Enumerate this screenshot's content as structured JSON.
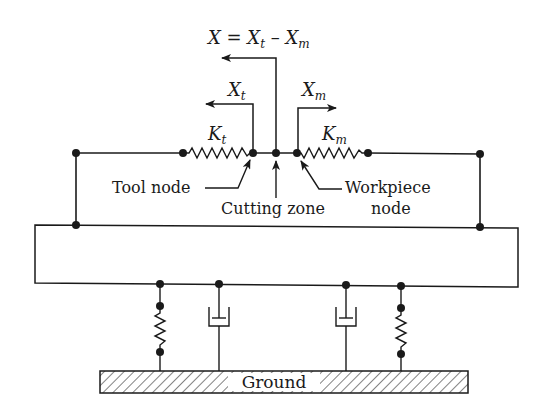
{
  "diagram": {
    "title_equation": {
      "lhs": "X",
      "eq": " = ",
      "xt_base": "X",
      "xt_sub": "t",
      "minus": " – ",
      "xm_base": "X",
      "xm_sub": "m"
    },
    "displacements": {
      "tool": {
        "base": "X",
        "sub": "t"
      },
      "workpiece": {
        "base": "X",
        "sub": "m"
      }
    },
    "springs": {
      "tool": {
        "base": "K",
        "sub": "t"
      },
      "workpiece": {
        "base": "K",
        "sub": "m"
      }
    },
    "labels": {
      "tool_node": "Tool node",
      "cutting_zone": "Cutting zone",
      "workpiece_line1": "Workpiece",
      "workpiece_line2": "node",
      "ground": "Ground"
    },
    "colors": {
      "line": "#1a1a1a",
      "background": "#ffffff"
    }
  }
}
